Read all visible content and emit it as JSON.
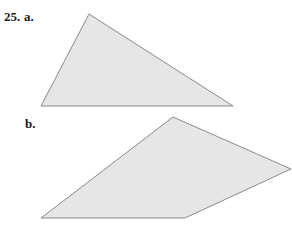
{
  "problem": {
    "number": "25.",
    "parts": [
      {
        "label": "a.",
        "shape": "triangle",
        "vertices": [
          [
            89,
            14
          ],
          [
            41,
            106
          ],
          [
            233,
            106
          ]
        ]
      },
      {
        "label": "b.",
        "shape": "quadrilateral",
        "vertices": [
          [
            173,
            117
          ],
          [
            291,
            169
          ],
          [
            185,
            218
          ],
          [
            41,
            218
          ]
        ]
      }
    ]
  },
  "colors": {
    "fill": "#e6e6e6",
    "stroke": "#8a8a8a",
    "text": "#1a1a1a"
  }
}
